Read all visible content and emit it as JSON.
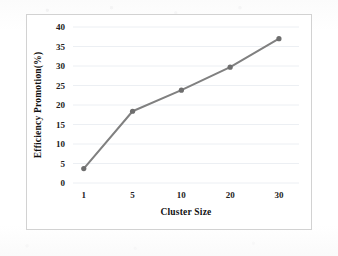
{
  "chart_data": {
    "type": "line",
    "title": "",
    "xlabel": "Cluster Size",
    "ylabel": "Efficiency  Promotion(%)",
    "categories": [
      "1",
      "5",
      "10",
      "20",
      "30"
    ],
    "values": [
      3.7,
      18.4,
      23.8,
      29.7,
      37.0
    ],
    "series": [
      {
        "name": "Efficiency Promotion",
        "values": [
          3.7,
          18.4,
          23.8,
          29.7,
          37.0
        ]
      }
    ],
    "ylim": [
      0,
      40
    ],
    "ytick_labels": [
      "0",
      "5",
      "10",
      "15",
      "20",
      "25",
      "30",
      "35",
      "40"
    ],
    "ytick_values": [
      0,
      5,
      10,
      15,
      20,
      25,
      30,
      35,
      40
    ],
    "xtick_labels": [
      "1",
      "5",
      "10",
      "20",
      "30"
    ],
    "grid": "horizontal",
    "legend": "none",
    "line_color": "#808080",
    "marker_color": "#6e6e6e",
    "marker_shape": "circle",
    "plot_border_color": "#d2d2d2",
    "background_color": "#ffffff"
  }
}
